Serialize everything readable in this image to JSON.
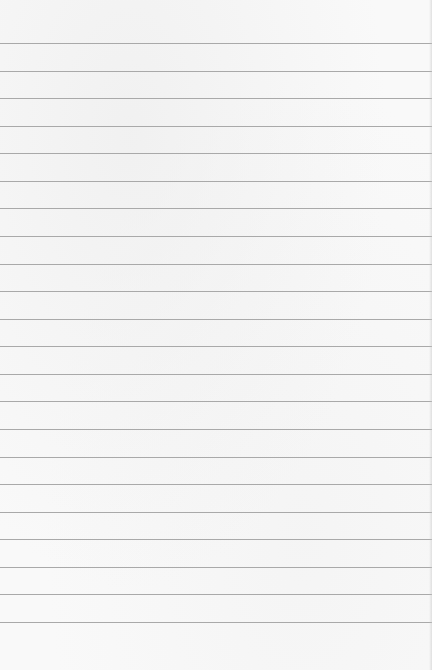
{
  "paper": {
    "type": "lined-notepad",
    "background_color": "#f9f9f9",
    "line_color": "#a9a9a9",
    "first_line_y": 43,
    "line_spacing": 27.57,
    "line_count": 22,
    "lines_text": [
      "",
      "",
      "",
      "",
      "",
      "",
      "",
      "",
      "",
      "",
      "",
      "",
      "",
      "",
      "",
      "",
      "",
      "",
      "",
      "",
      "",
      ""
    ]
  }
}
